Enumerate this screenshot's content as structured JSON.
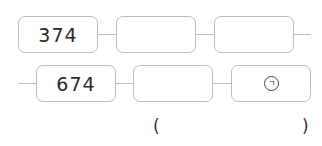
{
  "row1": {
    "boxes": [
      {
        "value": "374"
      },
      {
        "value": ""
      },
      {
        "value": ""
      }
    ]
  },
  "row2": {
    "boxes": [
      {
        "value": "674"
      },
      {
        "value": ""
      },
      {
        "value": "",
        "marker": "ㄱ"
      }
    ]
  },
  "answer": {
    "open_paren": "(",
    "value": "",
    "close_paren": ")"
  },
  "colors": {
    "border": "#bdbdbd",
    "text": "#2b2b2b"
  }
}
